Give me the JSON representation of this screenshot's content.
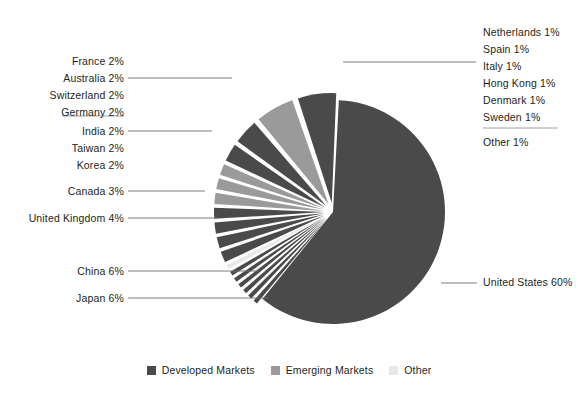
{
  "chart_data": {
    "type": "pie",
    "title": "",
    "center": {
      "x": 333,
      "y": 212
    },
    "radius": 112,
    "legend_position": "bottom",
    "categories": [
      "United States",
      "Japan",
      "China",
      "United Kingdom",
      "Canada",
      "Korea",
      "Taiwan",
      "India",
      "Germany",
      "Switzerland",
      "Australia",
      "France",
      "Other",
      "Sweden",
      "Denmark",
      "Hong Kong",
      "Italy",
      "Spain",
      "Netherlands"
    ],
    "values": [
      60,
      6,
      6,
      4,
      3,
      2,
      2,
      2,
      2,
      2,
      2,
      2,
      1,
      1,
      1,
      1,
      1,
      1,
      1
    ],
    "groups": [
      "Developed Markets",
      "Developed Markets",
      "Emerging Markets",
      "Developed Markets",
      "Developed Markets",
      "Emerging Markets",
      "Emerging Markets",
      "Emerging Markets",
      "Developed Markets",
      "Developed Markets",
      "Developed Markets",
      "Developed Markets",
      "Other",
      "Developed Markets",
      "Developed Markets",
      "Developed Markets",
      "Developed Markets",
      "Developed Markets",
      "Developed Markets"
    ],
    "slices": [
      {
        "name": "United States",
        "pct": 60,
        "label": "United States 60%",
        "group": "Developed Markets",
        "color": "#4a4a4a"
      },
      {
        "name": "Japan",
        "pct": 6,
        "label": "Japan 6%",
        "group": "Developed Markets",
        "color": "#4a4a4a"
      },
      {
        "name": "China",
        "pct": 6,
        "label": "China 6%",
        "group": "Emerging Markets",
        "color": "#9a9a9a"
      },
      {
        "name": "United Kingdom",
        "pct": 4,
        "label": "United Kingdom 4%",
        "group": "Developed Markets",
        "color": "#4a4a4a"
      },
      {
        "name": "Canada",
        "pct": 3,
        "label": "Canada 3%",
        "group": "Developed Markets",
        "color": "#4a4a4a"
      },
      {
        "name": "Korea",
        "pct": 2,
        "label": "Korea 2%",
        "group": "Emerging Markets",
        "color": "#9a9a9a"
      },
      {
        "name": "Taiwan",
        "pct": 2,
        "label": "Taiwan 2%",
        "group": "Emerging Markets",
        "color": "#9a9a9a"
      },
      {
        "name": "India",
        "pct": 2,
        "label": "India 2%",
        "group": "Emerging Markets",
        "color": "#9a9a9a"
      },
      {
        "name": "Germany",
        "pct": 2,
        "label": "Germany 2%",
        "group": "Developed Markets",
        "color": "#4a4a4a"
      },
      {
        "name": "Switzerland",
        "pct": 2,
        "label": "Switzerland 2%",
        "group": "Developed Markets",
        "color": "#4a4a4a"
      },
      {
        "name": "Australia",
        "pct": 2,
        "label": "Australia 2%",
        "group": "Developed Markets",
        "color": "#4a4a4a"
      },
      {
        "name": "France",
        "pct": 2,
        "label": "France 2%",
        "group": "Developed Markets",
        "color": "#4a4a4a"
      },
      {
        "name": "Other",
        "pct": 1,
        "label": "Other 1%",
        "group": "Other",
        "color": "#e8e8e8"
      },
      {
        "name": "Sweden",
        "pct": 1,
        "label": "Sweden 1%",
        "group": "Developed Markets",
        "color": "#4a4a4a"
      },
      {
        "name": "Denmark",
        "pct": 1,
        "label": "Denmark 1%",
        "group": "Developed Markets",
        "color": "#4a4a4a"
      },
      {
        "name": "Hong Kong",
        "pct": 1,
        "label": "Hong Kong 1%",
        "group": "Developed Markets",
        "color": "#4a4a4a"
      },
      {
        "name": "Italy",
        "pct": 1,
        "label": "Italy 1%",
        "group": "Developed Markets",
        "color": "#4a4a4a"
      },
      {
        "name": "Spain",
        "pct": 1,
        "label": "Spain 1%",
        "group": "Developed Markets",
        "color": "#4a4a4a"
      },
      {
        "name": "Netherlands",
        "pct": 1,
        "label": "Netherlands 1%",
        "group": "Developed Markets",
        "color": "#4a4a4a"
      }
    ],
    "legend": [
      {
        "label": "Developed Markets",
        "color": "#4a4a4a"
      },
      {
        "label": "Emerging Markets",
        "color": "#9a9a9a"
      },
      {
        "label": "Other",
        "color": "#e8e8e8"
      }
    ]
  },
  "labels": {
    "right_group": [
      "Netherlands 1%",
      "Spain 1%",
      "Italy 1%",
      "Hong Kong 1%",
      "Denmark 1%",
      "Sweden 1%"
    ],
    "right_other": "Other 1%",
    "right_us": "United States 60%",
    "left_group_a": [
      "France 2%",
      "Australia 2%",
      "Switzerland 2%",
      "Germany 2%"
    ],
    "left_group_b": [
      "India 2%",
      "Taiwan 2%",
      "Korea 2%"
    ],
    "left_canada": "Canada 3%",
    "left_uk": "United Kingdom 4%",
    "left_china": "China 6%",
    "left_japan": "Japan 6%"
  },
  "legend": {
    "items": [
      {
        "label": "Developed Markets",
        "color": "#4a4a4a"
      },
      {
        "label": "Emerging Markets",
        "color": "#9a9a9a"
      },
      {
        "label": "Other",
        "color": "#e8e8e8"
      }
    ]
  },
  "colors": {
    "developed": "#4a4a4a",
    "emerging": "#9a9a9a",
    "other": "#e8e8e8",
    "leader": "#6d6d6d",
    "text": "#231f20"
  }
}
